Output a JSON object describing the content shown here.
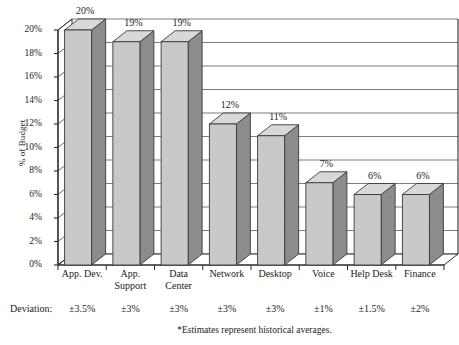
{
  "chart_data": {
    "type": "bar",
    "title": "",
    "xlabel": "",
    "ylabel": "% of Budget",
    "ylim": [
      0,
      20
    ],
    "ytick_labels": [
      "0%",
      "2%",
      "4%",
      "6%",
      "8%",
      "10%",
      "12%",
      "14%",
      "16%",
      "18%",
      "20%"
    ],
    "ytick_values": [
      0,
      2,
      4,
      6,
      8,
      10,
      12,
      14,
      16,
      18,
      20
    ],
    "grid": true,
    "legend": false,
    "categories": [
      "App. Dev.",
      "App.\nSupport",
      "Data\nCenter",
      "Network",
      "Desktop",
      "Voice",
      "Help Desk",
      "Finance"
    ],
    "values": [
      20,
      19,
      19,
      12,
      11,
      7,
      6,
      6
    ],
    "value_labels": [
      "20%",
      "19%",
      "19%",
      "12%",
      "11%",
      "7%",
      "6%",
      "6%"
    ],
    "deviations": [
      "±3.5%",
      "±3%",
      "±3%",
      "±3%",
      "±3%",
      "±1%",
      "±1.5%",
      "±2%"
    ],
    "deviation_row_label": "Deviation:",
    "footnote": "*Estimates represent historical averages.",
    "style": "3d-column-grayscale"
  },
  "colors": {
    "bar_front": "#c9c9c9",
    "bar_side": "#8c8c8c",
    "bar_top": "#d8d8d8",
    "bar_outline": "#3a3a3a",
    "gridline": "#6e6e6e",
    "axis": "#2b2b2b",
    "floor": "#9a9a9a",
    "background": "#ffffff",
    "text": "#1b1b1b"
  }
}
